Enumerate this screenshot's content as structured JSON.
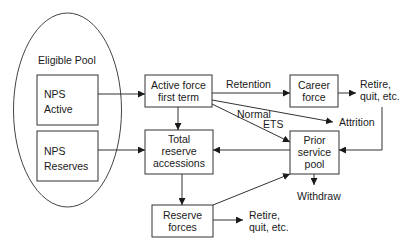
{
  "diagram": {
    "type": "flowchart",
    "title": "",
    "pool": {
      "label": "Eligible Pool"
    },
    "nodes": {
      "nps_active": {
        "line1": "NPS",
        "line2": "Active"
      },
      "nps_reserves": {
        "line1": "NPS",
        "line2": "Reserves"
      },
      "active_force": {
        "line1": "Active force",
        "line2": "first term"
      },
      "total_reserve": {
        "line1": "Total",
        "line2": "reserve",
        "line3": "accessions"
      },
      "reserve_forces": {
        "line1": "Reserve",
        "line2": "forces"
      },
      "career_force": {
        "line1": "Career",
        "line2": "force"
      },
      "prior_service": {
        "line1": "Prior",
        "line2": "service",
        "line3": "pool"
      }
    },
    "outcomes": {
      "career_exit": {
        "line1": "Retire,",
        "line2": "quit, etc."
      },
      "reserve_exit": {
        "line1": "Retire,",
        "line2": "quit, etc."
      },
      "attrition": "Attrition",
      "withdraw": "Withdraw"
    },
    "edge_labels": {
      "retention": "Retention",
      "normal": "Normal",
      "ets": "ETS"
    },
    "edges": [
      {
        "from": "NPS Active",
        "to": "Active force first term"
      },
      {
        "from": "NPS Reserves",
        "to": "Total reserve accessions"
      },
      {
        "from": "Active force first term",
        "to": "Career force",
        "label": "Retention"
      },
      {
        "from": "Active force first term",
        "to": "Attrition"
      },
      {
        "from": "Active force first term",
        "to": "Prior service pool",
        "label": "Normal ETS"
      },
      {
        "from": "Active force first term",
        "to": "Total reserve accessions"
      },
      {
        "from": "Career force",
        "to": "Retire, quit, etc."
      },
      {
        "from": "Retire, quit, etc.",
        "to": "Prior service pool"
      },
      {
        "from": "Prior service pool",
        "to": "Total reserve accessions"
      },
      {
        "from": "Prior service pool",
        "to": "Withdraw"
      },
      {
        "from": "Total reserve accessions",
        "to": "Reserve forces"
      },
      {
        "from": "Reserve forces",
        "to": "Prior service pool"
      },
      {
        "from": "Reserve forces",
        "to": "Retire, quit, etc."
      }
    ]
  }
}
